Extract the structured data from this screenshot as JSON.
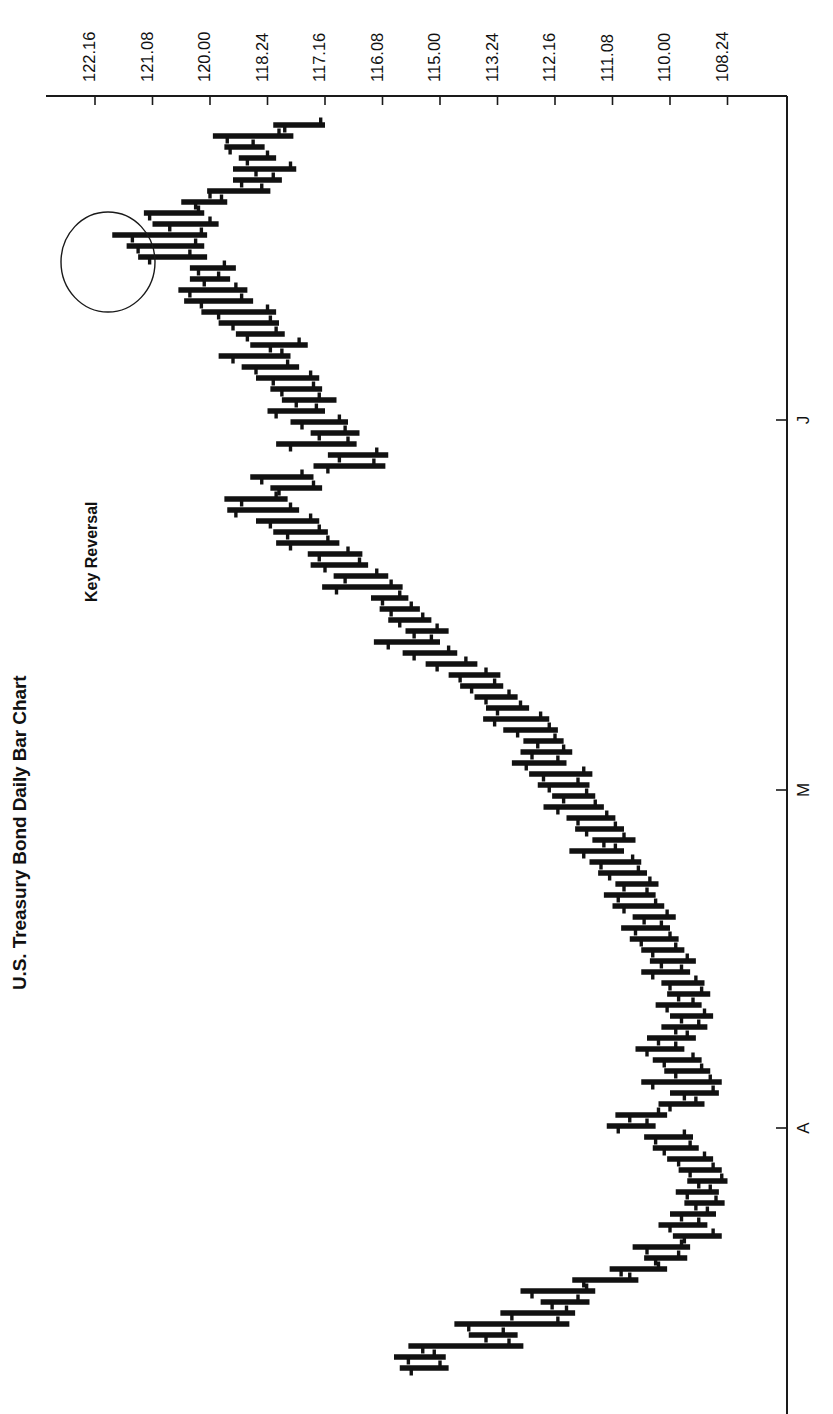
{
  "title": "U.S. Treasury Bond Daily Bar Chart",
  "annotation": {
    "label": "Key Reversal",
    "shape": "ellipse"
  },
  "colors": {
    "background": "#ffffff",
    "ink": "#111111",
    "axis": "#1a1a1a"
  },
  "chart_data": {
    "type": "ohlc-bar",
    "title": "U.S. Treasury Bond Daily Bar Chart",
    "orientation": "rotated-90-ccw",
    "xlabel": "",
    "ylabel": "",
    "grid": false,
    "legend": null,
    "price_axis": {
      "position": "top",
      "note": "Prices quoted in points and 32nds (e.g. 122.16 = 122-16/32)",
      "tick_labels": [
        "122.16",
        "121.08",
        "120.00",
        "118.24",
        "117.16",
        "116.08",
        "115.00",
        "113.24",
        "112.16",
        "111.08",
        "110.00",
        "108.24"
      ],
      "tick_values": [
        122.5,
        121.25,
        120.0,
        118.75,
        117.5,
        116.25,
        115.0,
        113.75,
        112.5,
        111.25,
        110.0,
        108.75
      ],
      "tick_px": [
        95,
        152.5,
        210,
        267.5,
        325,
        382.5,
        440,
        497.5,
        555,
        612.5,
        670,
        727.5
      ],
      "range": [
        108.75,
        122.5
      ]
    },
    "date_axis": {
      "position": "right",
      "tick_labels": [
        "J",
        "M",
        "A"
      ],
      "tick_px": [
        420,
        790,
        1128
      ],
      "note": "Month initials: June, May, April reading downward (time increases downward)"
    },
    "series_note": "Each bar: high-low range with open tick (left side) and close tick (right side). Values in points-32nds decimal.",
    "bars": [
      {
        "y": 125,
        "high": 118.2,
        "low": 117.16,
        "open": 118.12,
        "close": 117.19
      },
      {
        "y": 136,
        "high": 119.3,
        "low": 118.06,
        "open": 119.2,
        "close": 118.16
      },
      {
        "y": 147,
        "high": 119.22,
        "low": 118.26,
        "open": 119.18,
        "close": 119.02
      },
      {
        "y": 158,
        "high": 119.12,
        "low": 118.18,
        "open": 119.06,
        "close": 118.24
      },
      {
        "y": 169,
        "high": 119.16,
        "low": 118.04,
        "open": 119.0,
        "close": 118.08
      },
      {
        "y": 180,
        "high": 119.16,
        "low": 118.14,
        "open": 119.1,
        "close": 118.2
      },
      {
        "y": 191,
        "high": 120.02,
        "low": 118.22,
        "open": 120.0,
        "close": 118.28
      },
      {
        "y": 202,
        "high": 120.2,
        "low": 119.2,
        "open": 120.1,
        "close": 119.24
      },
      {
        "y": 213,
        "high": 121.14,
        "low": 120.04,
        "open": 121.1,
        "close": 120.08
      },
      {
        "y": 224,
        "high": 121.08,
        "low": 119.26,
        "open": 120.28,
        "close": 120.0
      },
      {
        "y": 235,
        "high": 122.04,
        "low": 120.02,
        "open": 121.22,
        "close": 120.06
      },
      {
        "y": 246,
        "high": 121.26,
        "low": 120.04,
        "open": 121.18,
        "close": 120.1
      },
      {
        "y": 257,
        "high": 121.18,
        "low": 120.02,
        "open": 121.1,
        "close": 120.14
      },
      {
        "y": 268,
        "high": 120.14,
        "low": 119.14,
        "open": 120.08,
        "close": 119.22
      },
      {
        "y": 279,
        "high": 120.14,
        "low": 119.18,
        "open": 120.04,
        "close": 119.26
      },
      {
        "y": 290,
        "high": 120.22,
        "low": 119.06,
        "open": 120.14,
        "close": 119.14
      },
      {
        "y": 301,
        "high": 120.18,
        "low": 119.02,
        "open": 120.06,
        "close": 119.1
      },
      {
        "y": 312,
        "high": 120.06,
        "low": 118.18,
        "open": 119.26,
        "close": 118.24
      },
      {
        "y": 323,
        "high": 119.26,
        "low": 118.16,
        "open": 119.16,
        "close": 118.22
      },
      {
        "y": 334,
        "high": 119.14,
        "low": 118.12,
        "open": 119.06,
        "close": 118.18
      },
      {
        "y": 345,
        "high": 119.04,
        "low": 117.28,
        "open": 118.22,
        "close": 118.02
      },
      {
        "y": 356,
        "high": 119.26,
        "low": 118.08,
        "open": 119.16,
        "close": 118.14
      },
      {
        "y": 367,
        "high": 119.1,
        "low": 118.02,
        "open": 119.0,
        "close": 118.1
      },
      {
        "y": 378,
        "high": 119.0,
        "low": 117.2,
        "open": 118.2,
        "close": 117.26
      },
      {
        "y": 389,
        "high": 118.22,
        "low": 117.18,
        "open": 118.14,
        "close": 117.24
      },
      {
        "y": 400,
        "high": 118.14,
        "low": 117.08,
        "open": 118.04,
        "close": 117.2
      },
      {
        "y": 411,
        "high": 118.24,
        "low": 117.16,
        "open": 118.18,
        "close": 117.22
      },
      {
        "y": 422,
        "high": 118.08,
        "low": 117.0,
        "open": 118.0,
        "close": 117.06
      },
      {
        "y": 433,
        "high": 117.26,
        "low": 116.24,
        "open": 117.2,
        "close": 117.02
      },
      {
        "y": 444,
        "high": 118.18,
        "low": 116.26,
        "open": 118.08,
        "close": 117.0
      },
      {
        "y": 455,
        "high": 117.14,
        "low": 116.04,
        "open": 117.06,
        "close": 116.12
      },
      {
        "y": 466,
        "high": 117.24,
        "low": 116.06,
        "open": 117.14,
        "close": 116.14
      },
      {
        "y": 477,
        "high": 119.04,
        "low": 117.24,
        "open": 118.28,
        "close": 118.0
      },
      {
        "y": 488,
        "high": 118.22,
        "low": 117.18,
        "open": 118.16,
        "close": 117.24
      },
      {
        "y": 499,
        "high": 119.22,
        "low": 118.1,
        "open": 119.1,
        "close": 118.18
      },
      {
        "y": 510,
        "high": 119.2,
        "low": 118.02,
        "open": 119.14,
        "close": 118.08
      },
      {
        "y": 521,
        "high": 119.0,
        "low": 117.2,
        "open": 118.22,
        "close": 117.26
      },
      {
        "y": 532,
        "high": 118.2,
        "low": 117.14,
        "open": 118.1,
        "close": 117.2
      },
      {
        "y": 543,
        "high": 118.18,
        "low": 117.06,
        "open": 118.08,
        "close": 117.14
      },
      {
        "y": 554,
        "high": 117.28,
        "low": 116.22,
        "open": 117.2,
        "close": 117.0
      },
      {
        "y": 565,
        "high": 117.26,
        "low": 116.18,
        "open": 117.16,
        "close": 116.24
      },
      {
        "y": 576,
        "high": 117.1,
        "low": 116.04,
        "open": 117.02,
        "close": 116.12
      },
      {
        "y": 587,
        "high": 117.18,
        "low": 115.26,
        "open": 117.08,
        "close": 116.02
      },
      {
        "y": 598,
        "high": 116.16,
        "low": 115.22,
        "open": 116.08,
        "close": 115.28
      },
      {
        "y": 609,
        "high": 116.1,
        "low": 115.14,
        "open": 116.02,
        "close": 115.2
      },
      {
        "y": 620,
        "high": 116.04,
        "low": 115.06,
        "open": 115.28,
        "close": 115.12
      },
      {
        "y": 631,
        "high": 115.24,
        "low": 114.26,
        "open": 115.18,
        "close": 115.02
      },
      {
        "y": 642,
        "high": 116.14,
        "low": 115.0,
        "open": 116.04,
        "close": 115.06
      },
      {
        "y": 653,
        "high": 115.26,
        "low": 114.2,
        "open": 115.18,
        "close": 114.26
      },
      {
        "y": 664,
        "high": 115.1,
        "low": 114.06,
        "open": 115.02,
        "close": 114.14
      },
      {
        "y": 675,
        "high": 114.26,
        "low": 113.22,
        "open": 114.18,
        "close": 114.0
      },
      {
        "y": 686,
        "high": 114.18,
        "low": 113.2,
        "open": 114.1,
        "close": 113.26
      },
      {
        "y": 697,
        "high": 114.08,
        "low": 113.1,
        "open": 114.0,
        "close": 113.16
      },
      {
        "y": 708,
        "high": 114.0,
        "low": 113.02,
        "open": 113.24,
        "close": 113.08
      },
      {
        "y": 719,
        "high": 114.02,
        "low": 112.2,
        "open": 113.26,
        "close": 112.26
      },
      {
        "y": 730,
        "high": 113.2,
        "low": 112.14,
        "open": 113.1,
        "close": 112.2
      },
      {
        "y": 741,
        "high": 113.06,
        "low": 112.1,
        "open": 112.28,
        "close": 112.16
      },
      {
        "y": 752,
        "high": 113.08,
        "low": 112.04,
        "open": 113.0,
        "close": 112.1
      },
      {
        "y": 763,
        "high": 113.14,
        "low": 112.08,
        "open": 113.04,
        "close": 112.14
      },
      {
        "y": 774,
        "high": 113.02,
        "low": 111.22,
        "open": 112.24,
        "close": 111.28
      },
      {
        "y": 785,
        "high": 112.28,
        "low": 111.24,
        "open": 112.2,
        "close": 112.0
      },
      {
        "y": 796,
        "high": 112.18,
        "low": 111.2,
        "open": 112.1,
        "close": 111.26
      },
      {
        "y": 807,
        "high": 112.24,
        "low": 111.14,
        "open": 112.14,
        "close": 111.2
      },
      {
        "y": 818,
        "high": 112.08,
        "low": 111.06,
        "open": 112.0,
        "close": 111.12
      },
      {
        "y": 829,
        "high": 112.02,
        "low": 111.0,
        "open": 111.26,
        "close": 111.06
      },
      {
        "y": 840,
        "high": 111.22,
        "low": 110.24,
        "open": 111.14,
        "close": 111.0
      },
      {
        "y": 851,
        "high": 112.06,
        "low": 111.0,
        "open": 111.28,
        "close": 111.06
      },
      {
        "y": 862,
        "high": 111.24,
        "low": 110.2,
        "open": 111.16,
        "close": 110.26
      },
      {
        "y": 873,
        "high": 111.18,
        "low": 110.16,
        "open": 111.1,
        "close": 110.22
      },
      {
        "y": 884,
        "high": 111.06,
        "low": 110.08,
        "open": 111.0,
        "close": 110.14
      },
      {
        "y": 895,
        "high": 111.14,
        "low": 110.1,
        "open": 111.04,
        "close": 110.16
      },
      {
        "y": 906,
        "high": 111.08,
        "low": 110.04,
        "open": 111.0,
        "close": 110.1
      },
      {
        "y": 917,
        "high": 110.26,
        "low": 109.28,
        "open": 110.18,
        "close": 110.02
      },
      {
        "y": 928,
        "high": 111.02,
        "low": 110.0,
        "open": 110.24,
        "close": 110.06
      },
      {
        "y": 939,
        "high": 110.28,
        "low": 109.26,
        "open": 110.2,
        "close": 110.0
      },
      {
        "y": 950,
        "high": 110.2,
        "low": 109.22,
        "open": 110.12,
        "close": 109.28
      },
      {
        "y": 961,
        "high": 110.14,
        "low": 109.14,
        "open": 110.06,
        "close": 109.2
      },
      {
        "y": 972,
        "high": 110.2,
        "low": 109.18,
        "open": 110.12,
        "close": 109.24
      },
      {
        "y": 983,
        "high": 110.06,
        "low": 109.08,
        "open": 110.0,
        "close": 109.14
      },
      {
        "y": 994,
        "high": 110.02,
        "low": 109.04,
        "open": 109.26,
        "close": 109.1
      },
      {
        "y": 1005,
        "high": 110.1,
        "low": 109.1,
        "open": 110.02,
        "close": 109.16
      },
      {
        "y": 1016,
        "high": 110.0,
        "low": 109.02,
        "open": 109.24,
        "close": 109.08
      },
      {
        "y": 1027,
        "high": 110.06,
        "low": 109.06,
        "open": 109.28,
        "close": 109.12
      },
      {
        "y": 1038,
        "high": 110.16,
        "low": 109.14,
        "open": 110.08,
        "close": 109.2
      },
      {
        "y": 1049,
        "high": 110.24,
        "low": 109.22,
        "open": 110.16,
        "close": 109.28
      },
      {
        "y": 1060,
        "high": 110.12,
        "low": 109.1,
        "open": 110.04,
        "close": 109.16
      },
      {
        "y": 1071,
        "high": 110.04,
        "low": 109.04,
        "open": 109.28,
        "close": 109.1
      },
      {
        "y": 1082,
        "high": 110.2,
        "low": 108.28,
        "open": 110.12,
        "close": 109.04
      },
      {
        "y": 1093,
        "high": 110.0,
        "low": 108.3,
        "open": 109.22,
        "close": 109.02
      },
      {
        "y": 1104,
        "high": 110.08,
        "low": 109.08,
        "open": 110.0,
        "close": 109.14
      },
      {
        "y": 1115,
        "high": 111.06,
        "low": 110.02,
        "open": 110.28,
        "close": 110.08
      },
      {
        "y": 1126,
        "high": 111.12,
        "low": 110.1,
        "open": 111.04,
        "close": 110.16
      },
      {
        "y": 1137,
        "high": 110.18,
        "low": 109.16,
        "open": 110.1,
        "close": 109.22
      },
      {
        "y": 1148,
        "high": 110.12,
        "low": 109.12,
        "open": 110.04,
        "close": 109.18
      },
      {
        "y": 1159,
        "high": 110.02,
        "low": 109.02,
        "open": 109.26,
        "close": 109.08
      },
      {
        "y": 1170,
        "high": 109.26,
        "low": 108.28,
        "open": 109.18,
        "close": 109.02
      },
      {
        "y": 1181,
        "high": 109.2,
        "low": 108.24,
        "open": 109.12,
        "close": 108.28
      },
      {
        "y": 1192,
        "high": 109.28,
        "low": 108.3,
        "open": 109.2,
        "close": 109.04
      },
      {
        "y": 1203,
        "high": 109.22,
        "low": 108.26,
        "open": 109.14,
        "close": 109.0
      },
      {
        "y": 1214,
        "high": 110.0,
        "low": 109.0,
        "open": 109.24,
        "close": 109.06
      },
      {
        "y": 1225,
        "high": 110.08,
        "low": 109.06,
        "open": 110.0,
        "close": 109.12
      },
      {
        "y": 1236,
        "high": 109.3,
        "low": 108.28,
        "open": 109.22,
        "close": 109.02
      },
      {
        "y": 1247,
        "high": 110.26,
        "low": 109.18,
        "open": 110.16,
        "close": 109.24
      },
      {
        "y": 1258,
        "high": 110.18,
        "low": 109.2,
        "open": 110.1,
        "close": 109.26
      },
      {
        "y": 1269,
        "high": 111.1,
        "low": 110.02,
        "open": 111.02,
        "close": 110.08
      },
      {
        "y": 1280,
        "high": 112.04,
        "low": 110.22,
        "open": 111.28,
        "close": 110.28
      },
      {
        "y": 1291,
        "high": 113.08,
        "low": 111.2,
        "open": 113.0,
        "close": 111.26
      },
      {
        "y": 1302,
        "high": 112.26,
        "low": 111.24,
        "open": 112.18,
        "close": 112.0
      },
      {
        "y": 1313,
        "high": 113.22,
        "low": 112.02,
        "open": 113.14,
        "close": 112.08
      },
      {
        "y": 1324,
        "high": 114.22,
        "low": 112.06,
        "open": 114.12,
        "close": 112.14
      },
      {
        "y": 1335,
        "high": 114.12,
        "low": 113.1,
        "open": 114.0,
        "close": 113.2
      },
      {
        "y": 1346,
        "high": 115.22,
        "low": 113.06,
        "open": 115.12,
        "close": 113.16
      },
      {
        "y": 1357,
        "high": 116.0,
        "low": 114.28,
        "open": 115.22,
        "close": 115.04
      },
      {
        "y": 1368,
        "high": 115.28,
        "low": 114.26,
        "open": 115.2,
        "close": 115.0
      }
    ]
  }
}
